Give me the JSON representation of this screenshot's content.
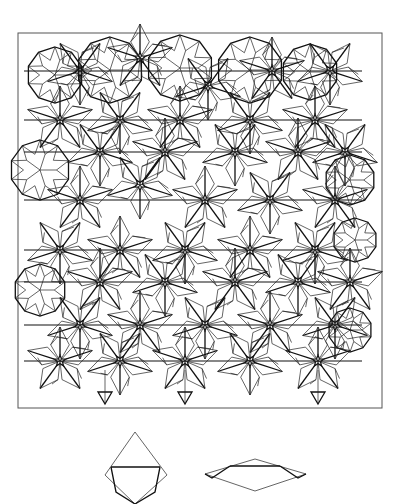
{
  "figure": {
    "frame": {
      "x": 18,
      "y": 33,
      "width": 364,
      "height": 375
    },
    "stroke_color": "#111111",
    "background": "#ffffff",
    "horizontal_lines_y": [
      71,
      120,
      152,
      200,
      250,
      282,
      325,
      361
    ],
    "pattern_x_range": [
      24,
      372
    ],
    "star_centers": [
      [
        80,
        71
      ],
      [
        140,
        58
      ],
      [
        208,
        86
      ],
      [
        272,
        71
      ],
      [
        330,
        71
      ],
      [
        60,
        120
      ],
      [
        120,
        120
      ],
      [
        180,
        120
      ],
      [
        250,
        120
      ],
      [
        315,
        120
      ],
      [
        100,
        152
      ],
      [
        165,
        152
      ],
      [
        235,
        152
      ],
      [
        298,
        152
      ],
      [
        345,
        152
      ],
      [
        80,
        200
      ],
      [
        140,
        185
      ],
      [
        205,
        200
      ],
      [
        270,
        200
      ],
      [
        335,
        200
      ],
      [
        60,
        250
      ],
      [
        120,
        250
      ],
      [
        185,
        250
      ],
      [
        250,
        250
      ],
      [
        315,
        250
      ],
      [
        100,
        282
      ],
      [
        165,
        282
      ],
      [
        235,
        282
      ],
      [
        298,
        282
      ],
      [
        350,
        282
      ],
      [
        80,
        325
      ],
      [
        140,
        325
      ],
      [
        205,
        325
      ],
      [
        270,
        325
      ],
      [
        335,
        325
      ],
      [
        60,
        361
      ],
      [
        120,
        361
      ],
      [
        185,
        361
      ],
      [
        250,
        361
      ],
      [
        318,
        361
      ]
    ],
    "dome_centers": [
      [
        55,
        75,
        28
      ],
      [
        110,
        70,
        33
      ],
      [
        180,
        68,
        33
      ],
      [
        250,
        70,
        33
      ],
      [
        310,
        72,
        28
      ],
      [
        40,
        170,
        30
      ],
      [
        350,
        180,
        25
      ],
      [
        355,
        240,
        22
      ],
      [
        40,
        290,
        26
      ],
      [
        350,
        330,
        22
      ]
    ],
    "bottom_points_x": [
      105,
      185,
      318
    ]
  },
  "prototiles": [
    {
      "name": "thick-rhombus",
      "points": [
        [
          135,
          432
        ],
        [
          167,
          475
        ],
        [
          135,
          504
        ],
        [
          105,
          475
        ]
      ],
      "inner_line": [
        [
          111,
          467
        ],
        [
          160,
          467
        ]
      ]
    },
    {
      "name": "thin-rhombus",
      "points": [
        [
          205,
          474
        ],
        [
          255,
          459
        ],
        [
          306,
          474
        ],
        [
          255,
          491
        ]
      ],
      "inner_line": [
        [
          230,
          466
        ],
        [
          280,
          466
        ]
      ]
    }
  ]
}
